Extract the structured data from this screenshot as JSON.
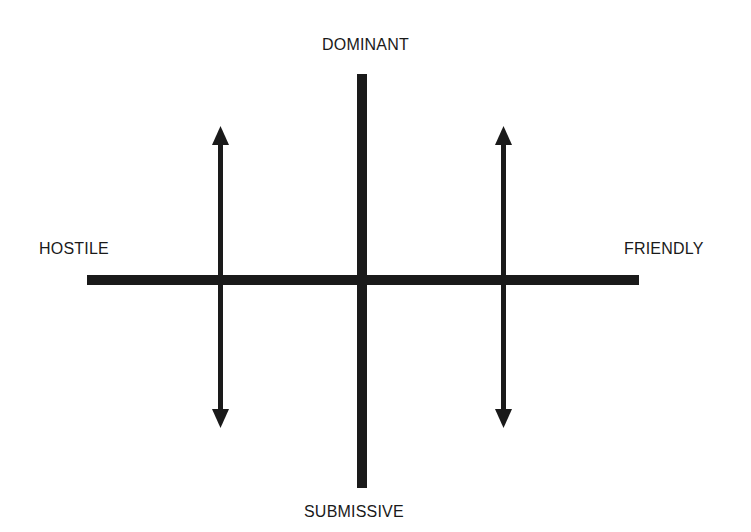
{
  "labels": {
    "top": "DOMINANT",
    "bottom": "SUBMISSIVE",
    "left": "HOSTILE",
    "right": "FRIENDLY"
  },
  "colors": {
    "ink": "#1a1a1a",
    "background": "#ffffff"
  },
  "axes": {
    "horizontal": {
      "from": "HOSTILE",
      "to": "FRIENDLY"
    },
    "vertical": {
      "from": "SUBMISSIVE",
      "to": "DOMINANT"
    }
  },
  "arrows": [
    {
      "position": "left",
      "direction": "bidirectional-vertical"
    },
    {
      "position": "right",
      "direction": "bidirectional-vertical"
    }
  ]
}
